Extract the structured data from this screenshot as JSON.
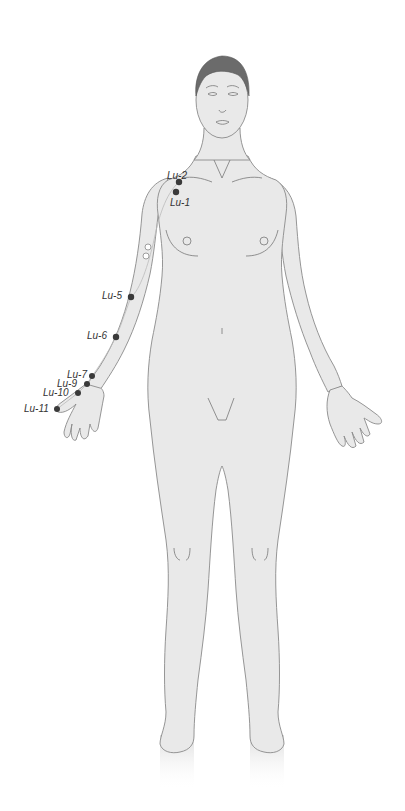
{
  "diagram": {
    "colors": {
      "background": "#ffffff",
      "skin": "#e9e9e9",
      "outline": "#8a8a8a",
      "hair": "#6b6b6b",
      "point": "#3a3a3a",
      "label": "#333333"
    },
    "points": [
      {
        "id": "Lu-1",
        "label": "Lu-1",
        "x": 176,
        "y": 192,
        "lx": 170,
        "ly": 198
      },
      {
        "id": "Lu-2",
        "label": "Lu-2",
        "x": 179,
        "y": 182,
        "lx": 167,
        "ly": 171
      },
      {
        "id": "Lu-5",
        "label": "Lu-5",
        "x": 131,
        "y": 297,
        "lx": 102,
        "ly": 291
      },
      {
        "id": "Lu-6",
        "label": "Lu-6",
        "x": 116,
        "y": 337,
        "lx": 87,
        "ly": 331
      },
      {
        "id": "Lu-7",
        "label": "Lu-7",
        "x": 92,
        "y": 376,
        "lx": 67,
        "ly": 370
      },
      {
        "id": "Lu-9",
        "label": "Lu-9",
        "x": 87,
        "y": 384,
        "lx": 57,
        "ly": 379
      },
      {
        "id": "Lu-10",
        "label": "Lu-10",
        "x": 78,
        "y": 393,
        "lx": 43,
        "ly": 389
      },
      {
        "id": "Lu-11",
        "label": "Lu-11",
        "x": 57,
        "y": 409,
        "lx": 24,
        "ly": 405
      }
    ],
    "hollow_points": [
      {
        "x": 148,
        "y": 247
      },
      {
        "x": 146,
        "y": 256
      }
    ]
  }
}
